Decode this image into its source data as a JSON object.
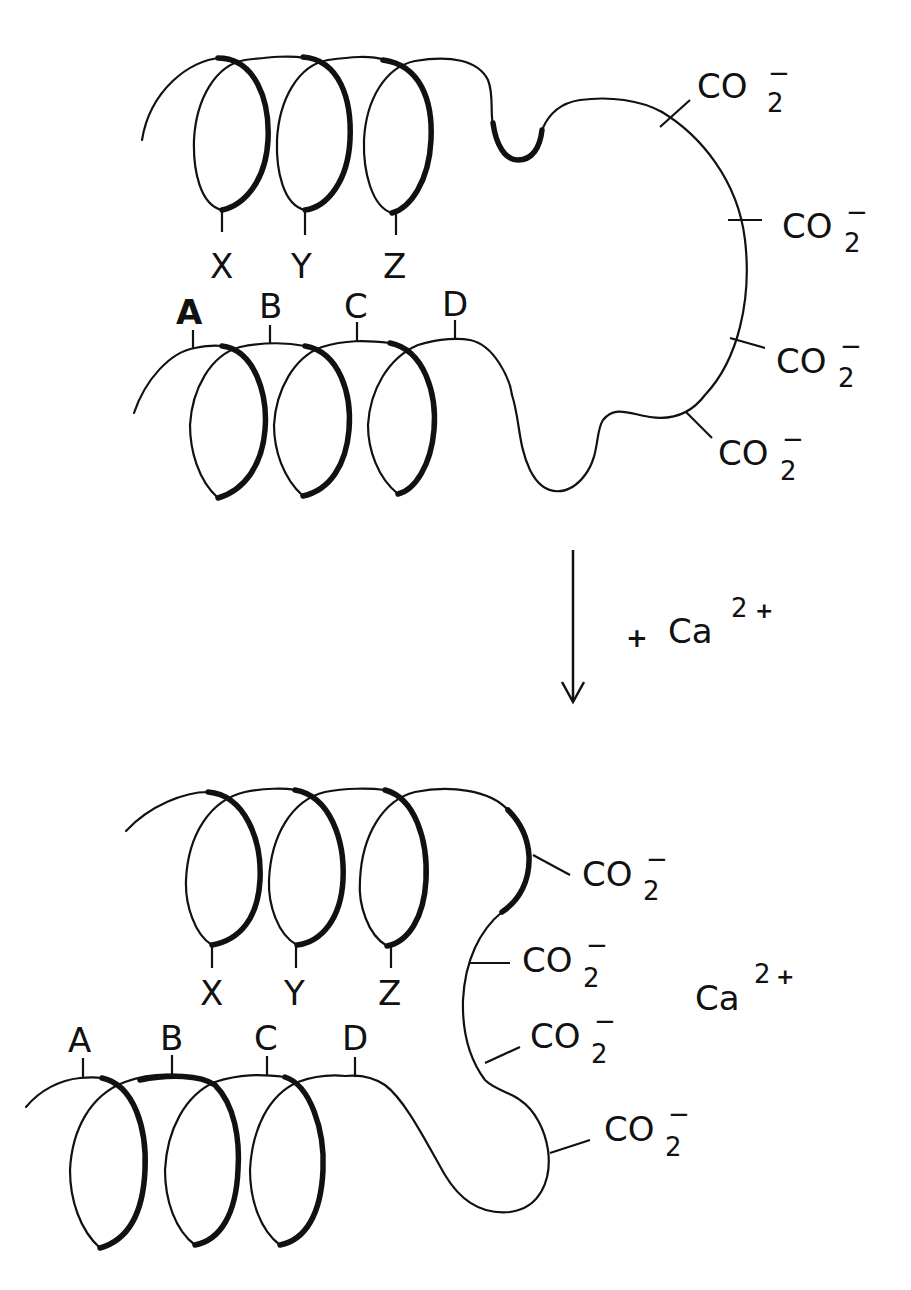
{
  "figure": {
    "top_state": {
      "upper_helix_labels": [
        "X",
        "Y",
        "Z"
      ],
      "lower_helix_labels": [
        "A",
        "B",
        "C",
        "D"
      ],
      "carboxylates": [
        "CO2-",
        "CO2-",
        "CO2-",
        "CO2-"
      ]
    },
    "transition": {
      "arrow": "down-arrow",
      "reagent_prefix": "+",
      "reagent": "Ca",
      "reagent_charge": "2+"
    },
    "bottom_state": {
      "upper_helix_labels": [
        "X",
        "Y",
        "Z"
      ],
      "lower_helix_labels": [
        "A",
        "B",
        "C",
        "D"
      ],
      "carboxylates": [
        "CO2-",
        "CO2-",
        "CO2-",
        "CO2-"
      ],
      "bound_ion": "Ca",
      "bound_ion_charge": "2+"
    }
  },
  "text": {
    "X": "X",
    "Y": "Y",
    "Z": "Z",
    "A": "A",
    "B": "B",
    "C": "C",
    "D": "D",
    "co": "CO",
    "two": "2",
    "minus": "−",
    "plus": "+",
    "ca": "Ca",
    "charge2": "2",
    "chargeplus": "+"
  }
}
